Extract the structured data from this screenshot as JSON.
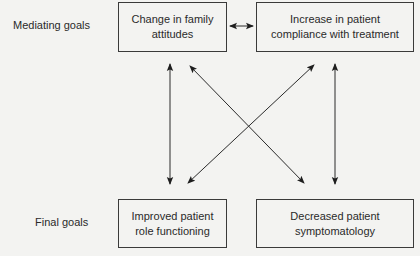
{
  "diagram": {
    "rows": {
      "mediating": {
        "label": "Mediating goals"
      },
      "final": {
        "label": "Final goals"
      }
    },
    "nodes": {
      "family_attitudes": {
        "line1": "Change in family",
        "line2": "attitudes"
      },
      "patient_compliance": {
        "line1": "Increase in patient",
        "line2": "compliance with treatment"
      },
      "role_functioning": {
        "line1": "Improved patient",
        "line2": "role functioning"
      },
      "symptomatology": {
        "line1": "Decreased patient",
        "line2": "symptomatology"
      }
    },
    "edges": [
      {
        "from": "family_attitudes",
        "to": "patient_compliance",
        "type": "bidirectional"
      },
      {
        "from": "family_attitudes",
        "to": "role_functioning",
        "type": "bidirectional"
      },
      {
        "from": "family_attitudes",
        "to": "symptomatology",
        "type": "bidirectional"
      },
      {
        "from": "patient_compliance",
        "to": "role_functioning",
        "type": "bidirectional"
      },
      {
        "from": "patient_compliance",
        "to": "symptomatology",
        "type": "bidirectional"
      }
    ],
    "colors": {
      "background": "#f3f3f1",
      "stroke": "#2a2a2a"
    }
  }
}
